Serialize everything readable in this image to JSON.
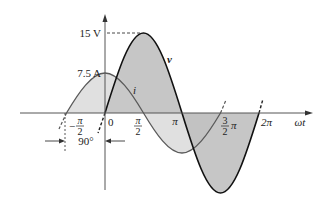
{
  "diagram": {
    "type": "phasor-waveform",
    "axes": {
      "x_label": "ωt",
      "ticks": [
        {
          "pos": "-pi/2",
          "num": "π",
          "den": "2",
          "sign": "−"
        },
        {
          "pos": "0",
          "text": "0"
        },
        {
          "pos": "pi/2",
          "num": "π",
          "den": "2"
        },
        {
          "pos": "pi",
          "text": "π"
        },
        {
          "pos": "3pi/2",
          "num": "3",
          "den": "2",
          "suffix": "π"
        },
        {
          "pos": "2pi",
          "text": "2π"
        }
      ]
    },
    "waveforms": [
      {
        "name": "v",
        "label": "v",
        "peak_label": "15 V",
        "amplitude": 15,
        "unit": "V",
        "phase_deg": 0,
        "fill": "#b9b9b9",
        "stroke": "#111111"
      },
      {
        "name": "i",
        "label": "i",
        "peak_label": "7.5 A",
        "amplitude": 7.5,
        "unit": "A",
        "phase_deg": 90,
        "fill": "#dcdcdc",
        "stroke": "#555555"
      }
    ],
    "phase_annotation": "90°"
  },
  "colors": {
    "axis": "#555555",
    "v_fill": "#b9b9b9",
    "i_fill": "#dedede",
    "v_stroke": "#111111",
    "i_stroke": "#5a5a5a"
  }
}
